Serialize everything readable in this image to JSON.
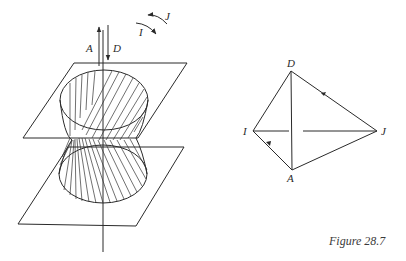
{
  "figure": {
    "caption": "Figure 28.7"
  },
  "left_diagram": {
    "description": "Hyperboloid of one sheet between two parallel planes with vertical axis",
    "axis_labels": {
      "up_arrow": "A",
      "down_arrow": "D"
    },
    "rotation_labels": {
      "upper": "J",
      "lower": "I"
    }
  },
  "right_diagram": {
    "description": "Quadrilateral with diagonals",
    "vertices": {
      "top": "D",
      "left": "I",
      "right": "J",
      "bottom": "A"
    }
  },
  "colors": {
    "ink": "#2a2a2a",
    "background": "#ffffff"
  }
}
